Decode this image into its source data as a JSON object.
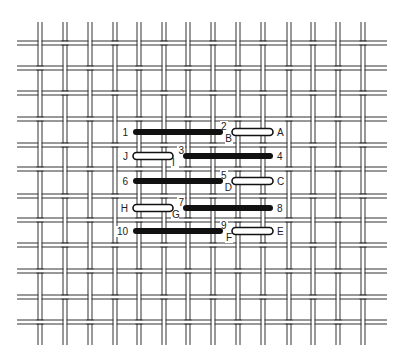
{
  "diagram": {
    "colors": {
      "thread_line": "#333333",
      "canvas_gap": "#ffffff",
      "stitch_front": "#111111",
      "stitch_back_fill": "#ffffff",
      "stitch_back_outline": "#111111"
    },
    "grid": {
      "vertical_threads": 14,
      "horizontal_threads": 12
    },
    "stitches": [
      {
        "type": "front",
        "from_label": "1",
        "to_label": "2",
        "row": 0,
        "start_col": 4,
        "end_col": 7
      },
      {
        "type": "back",
        "from_label": "B",
        "to_label": "A",
        "row": 0,
        "start_col": 8,
        "end_col": 9
      },
      {
        "type": "back",
        "from_label": "J",
        "to_label": "I",
        "row": 1,
        "start_col": 4,
        "end_col": 5
      },
      {
        "type": "front",
        "from_label": "3",
        "to_label": "4",
        "row": 1,
        "start_col": 6,
        "end_col": 9
      },
      {
        "type": "front",
        "from_label": "6",
        "to_label": "5",
        "row": 2,
        "start_col": 4,
        "end_col": 7
      },
      {
        "type": "back",
        "from_label": "D",
        "to_label": "C",
        "row": 2,
        "start_col": 8,
        "end_col": 9
      },
      {
        "type": "back",
        "from_label": "H",
        "to_label": "G",
        "row": 3,
        "start_col": 4,
        "end_col": 5
      },
      {
        "type": "front",
        "from_label": "7",
        "to_label": "8",
        "row": 3,
        "start_col": 6,
        "end_col": 9
      },
      {
        "type": "front",
        "from_label": "10",
        "to_label": "9",
        "row": 4,
        "start_col": 4,
        "end_col": 7
      },
      {
        "type": "back",
        "from_label": "F",
        "to_label": "E",
        "row": 4,
        "start_col": 8,
        "end_col": 9
      }
    ],
    "labels": [
      {
        "text": "1",
        "row": 0,
        "anchor": "left-of-start",
        "stitch": 0
      },
      {
        "text": "2",
        "row": 0,
        "anchor": "after-end-up",
        "stitch": 0
      },
      {
        "text": "B",
        "row": 0,
        "anchor": "before-start-down",
        "stitch": 1
      },
      {
        "text": "A",
        "row": 0,
        "anchor": "right-of-end",
        "stitch": 1
      },
      {
        "text": "J",
        "row": 1,
        "anchor": "left-of-start",
        "stitch": 2
      },
      {
        "text": "I",
        "row": 1,
        "anchor": "after-end-down",
        "stitch": 2
      },
      {
        "text": "3",
        "row": 1,
        "anchor": "before-start-up",
        "stitch": 3
      },
      {
        "text": "4",
        "row": 1,
        "anchor": "right-of-end",
        "stitch": 3
      },
      {
        "text": "6",
        "row": 2,
        "anchor": "left-of-start",
        "stitch": 4
      },
      {
        "text": "5",
        "row": 2,
        "anchor": "after-end-up",
        "stitch": 4
      },
      {
        "text": "D",
        "row": 2,
        "anchor": "before-start-down",
        "stitch": 5
      },
      {
        "text": "C",
        "row": 2,
        "anchor": "right-of-end",
        "stitch": 5
      },
      {
        "text": "H",
        "row": 3,
        "anchor": "left-of-start",
        "stitch": 6
      },
      {
        "text": "G",
        "row": 3,
        "anchor": "after-end-down",
        "stitch": 6
      },
      {
        "text": "7",
        "row": 3,
        "anchor": "before-start-up",
        "stitch": 7
      },
      {
        "text": "8",
        "row": 3,
        "anchor": "right-of-end",
        "stitch": 7
      },
      {
        "text": "10",
        "row": 4,
        "anchor": "left-of-start",
        "stitch": 8
      },
      {
        "text": "9",
        "row": 4,
        "anchor": "after-end-up",
        "stitch": 8
      },
      {
        "text": "F",
        "row": 4,
        "anchor": "before-start-down",
        "stitch": 9
      },
      {
        "text": "E",
        "row": 4,
        "anchor": "right-of-end",
        "stitch": 9
      }
    ]
  }
}
